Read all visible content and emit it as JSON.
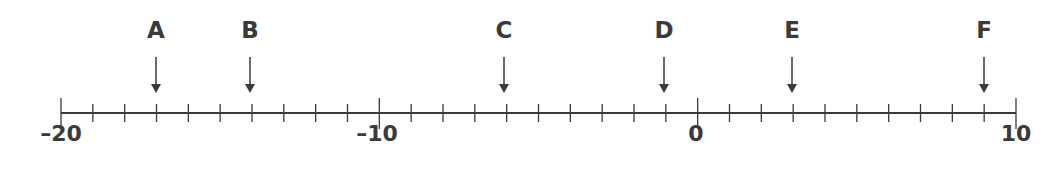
{
  "chart_data": {
    "type": "number_line",
    "range": [
      -20,
      10
    ],
    "tick_step": 1,
    "labeled_ticks": [
      {
        "value": -20,
        "label": "–20"
      },
      {
        "value": -10,
        "label": "–10"
      },
      {
        "value": 0,
        "label": "0"
      },
      {
        "value": 10,
        "label": "10"
      }
    ],
    "points": [
      {
        "letter": "A",
        "value": -17
      },
      {
        "letter": "B",
        "value": -14
      },
      {
        "letter": "C",
        "value": -6
      },
      {
        "letter": "D",
        "value": -1
      },
      {
        "letter": "E",
        "value": 3
      },
      {
        "letter": "F",
        "value": 9
      }
    ],
    "color": "#3a3a3a"
  },
  "labels": {
    "tick_m20": "–20",
    "tick_m10": "–10",
    "tick_0": "0",
    "tick_10": "10",
    "A": "A",
    "B": "B",
    "C": "C",
    "D": "D",
    "E": "E",
    "F": "F"
  }
}
